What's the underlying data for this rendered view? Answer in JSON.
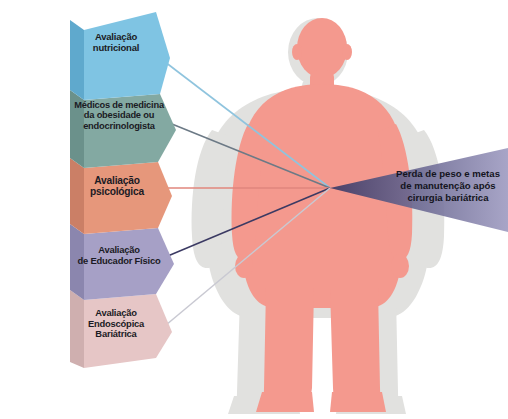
{
  "diagram": {
    "type": "funnel-convergence",
    "stages": [
      {
        "id": "stage-1",
        "label": "Avaliação\nnutricional",
        "color": "#7FC4E3",
        "side_color": "#5FA9CD",
        "line_color": "#8FC4DE"
      },
      {
        "id": "stage-2",
        "label": "Médicos de medicina\nda obesidade ou\nendocrinologista",
        "color": "#83A9A2",
        "side_color": "#6B918B",
        "line_color": "#6C7A86"
      },
      {
        "id": "stage-3",
        "label": "Avaliação\npsicológica",
        "color": "#E6977B",
        "side_color": "#CB7F66",
        "line_color": "#E0867D"
      },
      {
        "id": "stage-4",
        "label": "Avaliação\nde Educador Físico",
        "color": "#A6A0C6",
        "side_color": "#8B86AE",
        "line_color": "#3B3A63"
      },
      {
        "id": "stage-5",
        "label": "Avaliação\nEndoscópica\nBariátrica",
        "color": "#E6C6C6",
        "side_color": "#CFAFAF",
        "line_color": "#C9C9D2"
      }
    ],
    "outcome": {
      "label": "Perda de peso e metas de manutenção após cirurgia bariátrica",
      "arrow_color_start": "#3C3A66",
      "arrow_color_end": "#9A97BE"
    },
    "illustration": {
      "name": "body-silhouettes",
      "obese_figure_color": "#E0E0DE",
      "slim_figure_color": "#F4998E"
    }
  }
}
